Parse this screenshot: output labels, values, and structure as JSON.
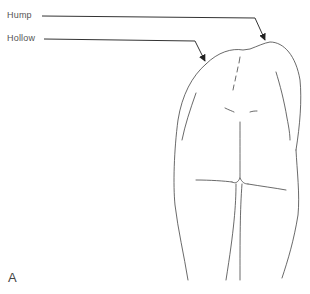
{
  "figure": {
    "panel_label": "A",
    "labels": [
      {
        "id": "hump",
        "text": "Hump"
      },
      {
        "id": "hollow",
        "text": "Hollow"
      }
    ],
    "colors": {
      "line": "#333333",
      "text": "#555555",
      "background": "#ffffff"
    }
  }
}
